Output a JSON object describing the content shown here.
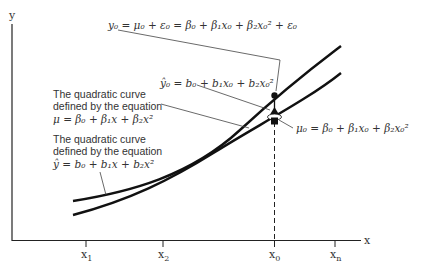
{
  "axes": {
    "y_label": "y",
    "x_label": "x",
    "ticks": [
      "x1",
      "x2",
      "x0",
      "xn"
    ]
  },
  "tick_labels": {
    "x1": {
      "main": "x",
      "sub": "1"
    },
    "x2": {
      "main": "x",
      "sub": "2"
    },
    "x0": {
      "main": "x",
      "sub": "0"
    },
    "xn": {
      "main": "x",
      "sub": "n"
    }
  },
  "annotations": {
    "y0_eq": "y₀ = μ₀ + ε₀ = β₀ + β₁x₀ + β₂x₀² + ε₀",
    "yhat0_eq": "ŷ₀ = b₀ + b₁x₀ + b₂x₀²",
    "mu0_eq": "μ₀ = β₀ + β₁x₀ + β₂x₀²",
    "true_curve": {
      "line1": "The quadratic curve",
      "line2": "defined by the equation",
      "eq": "μ = β₀ + β₁x + β₂x²"
    },
    "fitted_curve": {
      "line1": "The quadratic curve",
      "line2": "defined by the equation",
      "eq": "ŷ = b₀ + b₁x + b₂x²"
    }
  },
  "colors": {
    "line": "#111111",
    "text": "#333333",
    "background": "#ffffff"
  }
}
